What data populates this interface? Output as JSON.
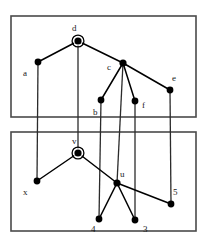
{
  "figure": {
    "title": "",
    "boxes": [
      {
        "name": "upper-region",
        "x": 11,
        "y": 16,
        "width": 185,
        "height": 101
      },
      {
        "name": "lower-region",
        "x": 11,
        "y": 132,
        "width": 185,
        "height": 99
      }
    ],
    "nodes": [
      {
        "id": "d",
        "label": "d",
        "x": 78,
        "y": 41,
        "r": 3.6,
        "type": "root",
        "label_x": 72,
        "label_y": 31
      },
      {
        "id": "a",
        "label": "a",
        "x": 38,
        "y": 62,
        "r": 3.4,
        "type": "plain",
        "label_x": 23,
        "label_y": 76
      },
      {
        "id": "c",
        "label": "c",
        "x": 123,
        "y": 63,
        "r": 3.6,
        "type": "plain",
        "label_x": 107,
        "label_y": 70
      },
      {
        "id": "e",
        "label": "e",
        "x": 170,
        "y": 90,
        "r": 3.4,
        "type": "plain",
        "label_x": 172,
        "label_y": 81
      },
      {
        "id": "b",
        "label": "b",
        "x": 101,
        "y": 100,
        "r": 3.4,
        "type": "plain",
        "label_x": 93,
        "label_y": 115
      },
      {
        "id": "f",
        "label": "f",
        "x": 135,
        "y": 101,
        "r": 3.4,
        "type": "plain",
        "label_x": 142,
        "label_y": 108
      },
      {
        "id": "v",
        "label": "v",
        "x": 78,
        "y": 153,
        "r": 3.6,
        "type": "root",
        "label_x": 72,
        "label_y": 144
      },
      {
        "id": "x",
        "label": "x",
        "x": 37,
        "y": 181,
        "r": 3.4,
        "type": "plain",
        "label_x": 23,
        "label_y": 195
      },
      {
        "id": "u",
        "label": "u",
        "x": 117,
        "y": 183,
        "r": 3.6,
        "type": "plain",
        "label_x": 120,
        "label_y": 177
      },
      {
        "id": "n4",
        "label": "4",
        "x": 99,
        "y": 219,
        "r": 3.4,
        "type": "plain",
        "label_x": 91,
        "label_y": 232
      },
      {
        "id": "n3",
        "label": "3",
        "x": 135,
        "y": 220,
        "r": 3.4,
        "type": "plain",
        "label_x": 143,
        "label_y": 232
      },
      {
        "id": "n5",
        "label": "5",
        "x": 171,
        "y": 204,
        "r": 3.4,
        "type": "plain",
        "label_x": 173,
        "label_y": 195
      }
    ],
    "tree_edges": [
      {
        "from": "d",
        "to": "a"
      },
      {
        "from": "d",
        "to": "c"
      },
      {
        "from": "c",
        "to": "b"
      },
      {
        "from": "c",
        "to": "f"
      },
      {
        "from": "c",
        "to": "e"
      },
      {
        "from": "v",
        "to": "x"
      },
      {
        "from": "v",
        "to": "u"
      },
      {
        "from": "u",
        "to": "n4"
      },
      {
        "from": "u",
        "to": "n3"
      },
      {
        "from": "u",
        "to": "n5"
      }
    ],
    "link_edges": [
      {
        "name": "link-a-x",
        "x1": 38,
        "y1": 62,
        "x2": 37,
        "y2": 181
      },
      {
        "name": "link-d-v",
        "x1": 78,
        "y1": 41,
        "x2": 78,
        "y2": 153
      },
      {
        "name": "link-b-n4",
        "x1": 101,
        "y1": 100,
        "x2": 99,
        "y2": 219
      },
      {
        "name": "link-c-u",
        "x1": 123,
        "y1": 63,
        "x2": 117,
        "y2": 183
      },
      {
        "name": "link-f-n3",
        "x1": 135,
        "y1": 101,
        "x2": 135,
        "y2": 220
      },
      {
        "name": "link-e-n5",
        "x1": 170,
        "y1": 90,
        "x2": 171,
        "y2": 204
      }
    ],
    "colors": {
      "node": "#000000",
      "edge": "#000000",
      "box_border": "#4a4a4a",
      "background": "#ffffff",
      "label": "#1a1a1a"
    }
  }
}
